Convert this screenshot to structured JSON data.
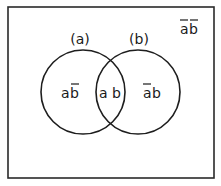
{
  "diagram": {
    "type": "venn",
    "frame": {
      "x": 8,
      "y": 7,
      "width": 206,
      "height": 171,
      "stroke": "#2a2a2a"
    },
    "sets": [
      {
        "id": "a",
        "label": "(a)",
        "cx": 83,
        "cy": 92,
        "r": 42
      },
      {
        "id": "b",
        "label": "(b)",
        "cx": 138,
        "cy": 92,
        "r": 42
      }
    ],
    "regions": {
      "a_only": {
        "base": "ab",
        "overline_on": "b",
        "text_a": "a",
        "text_b": "b"
      },
      "both": {
        "text": "a b"
      },
      "b_only": {
        "base": "ab",
        "overline_on": "a",
        "text_a": "a",
        "text_b": "b"
      },
      "neither": {
        "base": "ab",
        "overline_on": "both",
        "text_a": "a",
        "text_b": "b"
      }
    },
    "stroke_color": "#1e1e1e"
  }
}
